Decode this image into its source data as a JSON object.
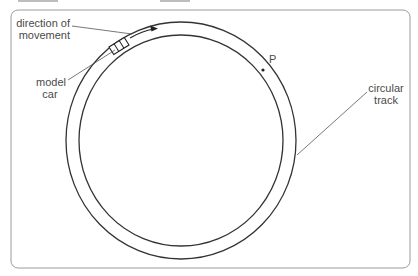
{
  "diagram": {
    "frame": {
      "x": 11,
      "y": 10,
      "width": 399,
      "height": 258,
      "radius": 7,
      "stroke": "#9a9a9a"
    },
    "track": {
      "center": [
        181,
        140
      ],
      "outer": {
        "rx": 115,
        "ry": 118
      },
      "inner": {
        "rx": 102,
        "ry": 105
      },
      "stroke": "#333333"
    },
    "labels": {
      "direction_line1": "direction of",
      "direction_line2": "movement",
      "car_line1": "model",
      "car_line2": "car",
      "point": "P",
      "track_line1": "circular",
      "track_line2": "track"
    },
    "point_P": {
      "x": 263,
      "y": 70
    }
  }
}
